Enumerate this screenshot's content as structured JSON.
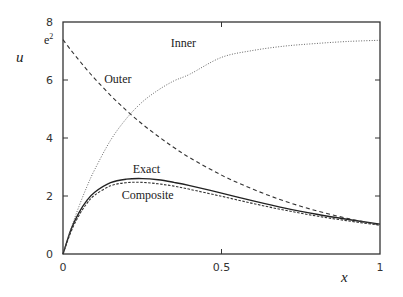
{
  "chart_data": {
    "type": "line",
    "title": "",
    "xlabel": "x",
    "ylabel": "u",
    "xlim": [
      0,
      1
    ],
    "ylim": [
      0,
      8
    ],
    "grid": false,
    "legend": "inline curve labels",
    "x_ticks": [
      {
        "value": 0,
        "label": "0"
      },
      {
        "value": 0.5,
        "label": "0.5"
      },
      {
        "value": 1,
        "label": "1"
      }
    ],
    "y_ticks": [
      {
        "value": 0,
        "label": "0"
      },
      {
        "value": 2,
        "label": "2"
      },
      {
        "value": 4,
        "label": "4"
      },
      {
        "value": 6,
        "label": "6"
      },
      {
        "value": 8,
        "label": "8"
      }
    ],
    "special_tick": {
      "value": 7.389,
      "label": "e2"
    },
    "x": [
      0,
      0.025,
      0.05,
      0.075,
      0.1,
      0.15,
      0.2,
      0.25,
      0.3,
      0.35,
      0.4,
      0.5,
      0.6,
      0.7,
      0.8,
      0.9,
      1.0
    ],
    "series": [
      {
        "name": "Exact",
        "style": "solid",
        "values": [
          0,
          0.84,
          1.42,
          1.84,
          2.13,
          2.46,
          2.58,
          2.6,
          2.56,
          2.47,
          2.36,
          2.1,
          1.83,
          1.58,
          1.37,
          1.19,
          1.03
        ]
      },
      {
        "name": "Composite",
        "style": "dashed-fine",
        "values": [
          0,
          0.76,
          1.32,
          1.74,
          2.03,
          2.35,
          2.46,
          2.47,
          2.42,
          2.34,
          2.23,
          1.99,
          1.74,
          1.51,
          1.31,
          1.14,
          0.99
        ]
      },
      {
        "name": "Outer",
        "style": "dashed",
        "values": [
          7.39,
          7.03,
          6.69,
          6.36,
          6.05,
          5.47,
          4.95,
          4.48,
          4.06,
          3.67,
          3.32,
          2.72,
          2.23,
          1.82,
          1.49,
          1.22,
          1.0
        ]
      },
      {
        "name": "Inner",
        "style": "dotted",
        "values": [
          0,
          0.87,
          1.63,
          2.31,
          2.91,
          3.92,
          4.67,
          5.24,
          5.65,
          5.97,
          6.2,
          6.78,
          7.02,
          7.17,
          7.26,
          7.33,
          7.37
        ]
      }
    ],
    "annotations": [
      {
        "text": "Inner",
        "x": 0.34,
        "y": 7.15
      },
      {
        "text": "Outer",
        "x": 0.13,
        "y": 5.9
      },
      {
        "text": "Exact",
        "x": 0.22,
        "y": 2.8
      },
      {
        "text": "Composite",
        "x": 0.185,
        "y": 1.88
      }
    ]
  }
}
